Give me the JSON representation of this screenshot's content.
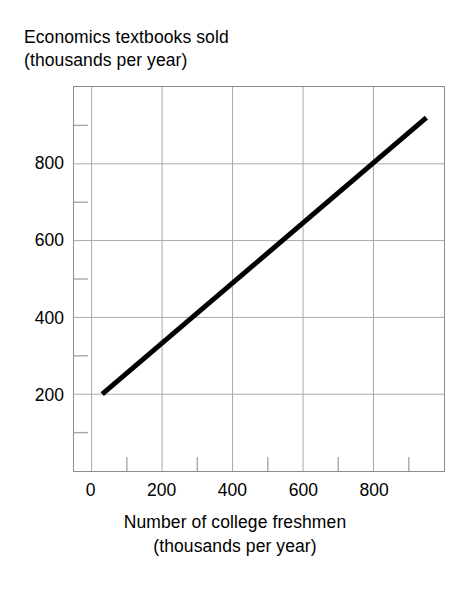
{
  "chart_data": {
    "type": "line",
    "title": "",
    "xlabel": "Number of college freshmen (thousands per year)",
    "ylabel": "Economics textbooks sold (thousands per year)",
    "xlabel_lines": [
      "Number of college freshmen",
      "(thousands per year)"
    ],
    "ylabel_lines": [
      "Economics textbooks sold",
      "(thousands per year)"
    ],
    "xlim": [
      -50,
      1000
    ],
    "ylim": [
      0,
      1000
    ],
    "grid": true,
    "legend": "none",
    "xticks": [
      0,
      200,
      400,
      600,
      800
    ],
    "xtick_labels": [
      "0",
      "200",
      "400",
      "600",
      "800"
    ],
    "yticks": [
      200,
      400,
      600,
      800
    ],
    "ytick_labels": [
      "200",
      "400",
      "600",
      "800"
    ],
    "x_minor_ticks": [
      100,
      300,
      500,
      700,
      900
    ],
    "y_minor_ticks": [
      100,
      300,
      500,
      700,
      900
    ],
    "series": [
      {
        "name": "Economics textbooks sold",
        "color": "#000000",
        "line_width": 5,
        "x": [
          30,
          950
        ],
        "y": [
          200,
          920
        ],
        "points": [
          {
            "x": 30,
            "y": 200
          },
          {
            "x": 200,
            "y": 333
          },
          {
            "x": 400,
            "y": 489
          },
          {
            "x": 600,
            "y": 646
          },
          {
            "x": 800,
            "y": 802
          },
          {
            "x": 950,
            "y": 920
          }
        ],
        "slope": 0.78,
        "intercept": 177
      }
    ],
    "colors": {
      "line": "#000000",
      "grid": "#a8a8a8",
      "axis_border": "#8c8c8c",
      "background": "#ffffff",
      "text": "#000000"
    }
  }
}
